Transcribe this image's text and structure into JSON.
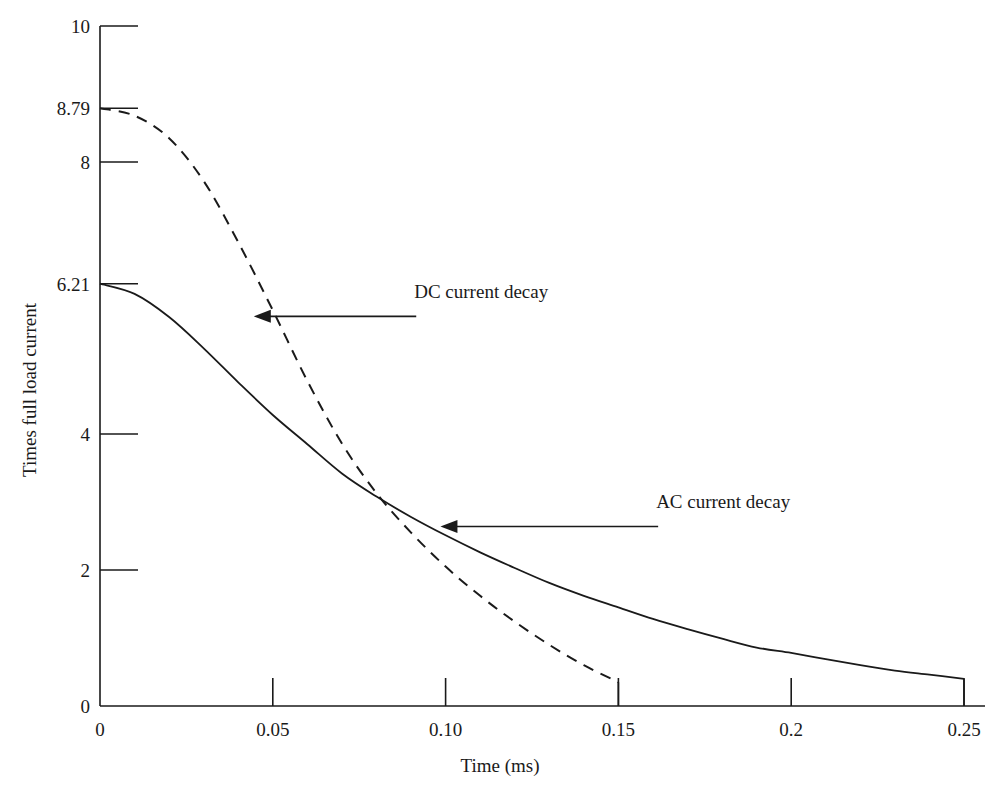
{
  "chart_data": {
    "type": "line",
    "title": "",
    "xlabel": "Time (ms)",
    "ylabel": "Times full load current",
    "xlim": [
      0,
      0.25
    ],
    "ylim": [
      0,
      10
    ],
    "grid": false,
    "legend_position": "inline-annotations",
    "x_ticks": [
      {
        "value": 0,
        "label": "0"
      },
      {
        "value": 0.05,
        "label": "0.05"
      },
      {
        "value": 0.1,
        "label": "0.10"
      },
      {
        "value": 0.15,
        "label": "0.15"
      },
      {
        "value": 0.2,
        "label": "0.2"
      },
      {
        "value": 0.25,
        "label": "0.25"
      }
    ],
    "y_ticks": [
      {
        "value": 0,
        "label": "0"
      },
      {
        "value": 2,
        "label": "2"
      },
      {
        "value": 4,
        "label": "4"
      },
      {
        "value": 6.21,
        "label": "6.21"
      },
      {
        "value": 8,
        "label": "8"
      },
      {
        "value": 8.79,
        "label": "8.79"
      },
      {
        "value": 10,
        "label": "10"
      }
    ],
    "series": [
      {
        "name": "AC current decay",
        "style": "solid",
        "color": "#1a1a1a",
        "start_value": 6.21,
        "end_value": 0.4,
        "points": [
          {
            "x": 0.0,
            "y": 6.21
          },
          {
            "x": 0.01,
            "y": 6.06
          },
          {
            "x": 0.02,
            "y": 5.72
          },
          {
            "x": 0.03,
            "y": 5.26
          },
          {
            "x": 0.04,
            "y": 4.76
          },
          {
            "x": 0.05,
            "y": 4.28
          },
          {
            "x": 0.06,
            "y": 3.85
          },
          {
            "x": 0.07,
            "y": 3.42
          },
          {
            "x": 0.08,
            "y": 3.08
          },
          {
            "x": 0.09,
            "y": 2.78
          },
          {
            "x": 0.1,
            "y": 2.51
          },
          {
            "x": 0.11,
            "y": 2.26
          },
          {
            "x": 0.12,
            "y": 2.03
          },
          {
            "x": 0.13,
            "y": 1.81
          },
          {
            "x": 0.14,
            "y": 1.62
          },
          {
            "x": 0.15,
            "y": 1.45
          },
          {
            "x": 0.16,
            "y": 1.28
          },
          {
            "x": 0.17,
            "y": 1.13
          },
          {
            "x": 0.18,
            "y": 0.99
          },
          {
            "x": 0.19,
            "y": 0.86
          },
          {
            "x": 0.2,
            "y": 0.78
          },
          {
            "x": 0.21,
            "y": 0.69
          },
          {
            "x": 0.22,
            "y": 0.6
          },
          {
            "x": 0.23,
            "y": 0.52
          },
          {
            "x": 0.24,
            "y": 0.46
          },
          {
            "x": 0.25,
            "y": 0.4
          }
        ],
        "drop_line_at_x": 0.25
      },
      {
        "name": "DC current decay",
        "style": "dashed",
        "color": "#1a1a1a",
        "start_value": 8.79,
        "end_value": 0.35,
        "points": [
          {
            "x": 0.0,
            "y": 8.79
          },
          {
            "x": 0.01,
            "y": 8.68
          },
          {
            "x": 0.02,
            "y": 8.35
          },
          {
            "x": 0.03,
            "y": 7.72
          },
          {
            "x": 0.04,
            "y": 6.82
          },
          {
            "x": 0.05,
            "y": 5.82
          },
          {
            "x": 0.06,
            "y": 4.78
          },
          {
            "x": 0.07,
            "y": 3.86
          },
          {
            "x": 0.08,
            "y": 3.13
          },
          {
            "x": 0.09,
            "y": 2.55
          },
          {
            "x": 0.1,
            "y": 2.05
          },
          {
            "x": 0.11,
            "y": 1.62
          },
          {
            "x": 0.12,
            "y": 1.24
          },
          {
            "x": 0.13,
            "y": 0.9
          },
          {
            "x": 0.14,
            "y": 0.6
          },
          {
            "x": 0.15,
            "y": 0.35
          }
        ],
        "drop_line_at_x": 0.15
      }
    ],
    "annotations": [
      {
        "text": "DC current decay",
        "target_series": "DC current decay",
        "target_x": 0.0445,
        "target_y": 5.73,
        "arrow_from_x": 0.0915,
        "arrow_to_x": 0.0445
      },
      {
        "text": "AC current decay",
        "target_series": "AC current decay",
        "target_x": 0.0985,
        "target_y": 2.64,
        "arrow_from_x": 0.1615,
        "arrow_to_x": 0.0985
      }
    ]
  }
}
